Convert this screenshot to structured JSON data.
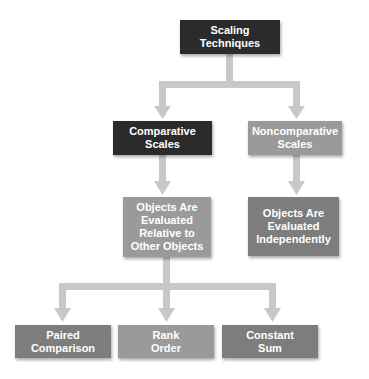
{
  "title": "Scaling Techniques",
  "nodes": {
    "root": {
      "label": "Scaling\nTechniques",
      "color": "#2b2b2b"
    },
    "comparative": {
      "label": "Comparative\nScales",
      "color": "#2b2b2b"
    },
    "noncomparative": {
      "label": "Noncomparative\nScales",
      "color": "#9a9a9a"
    },
    "comparative_desc": {
      "label": "Objects Are\nEvaluated\nRelative to\nOther Objects",
      "color": "#9a9a9a"
    },
    "noncomparative_desc": {
      "label": "Objects Are\nEvaluated\nIndependently",
      "color": "#7d7d7d"
    },
    "paired_comparison": {
      "label": "Paired\nComparison",
      "color": "#7d7d7d"
    },
    "rank_order": {
      "label": "Rank\nOrder",
      "color": "#9a9a9a"
    },
    "constant_sum": {
      "label": "Constant\nSum",
      "color": "#7d7d7d"
    }
  },
  "edges": [
    {
      "from": "Scaling Techniques",
      "to": "Comparative Scales"
    },
    {
      "from": "Scaling Techniques",
      "to": "Noncomparative Scales"
    },
    {
      "from": "Comparative Scales",
      "to": "Objects Are Evaluated Relative to Other Objects"
    },
    {
      "from": "Noncomparative Scales",
      "to": "Objects Are Evaluated Independently"
    },
    {
      "from": "Objects Are Evaluated Relative to Other Objects",
      "to": "Paired Comparison"
    },
    {
      "from": "Objects Are Evaluated Relative to Other Objects",
      "to": "Rank Order"
    },
    {
      "from": "Objects Are Evaluated Relative to Other Objects",
      "to": "Constant Sum"
    }
  ],
  "colors": {
    "connector": "#c8c8c8",
    "dark_node": "#2b2b2b",
    "mid_node": "#7d7d7d",
    "light_node": "#9a9a9a",
    "text": "#ffffff"
  }
}
